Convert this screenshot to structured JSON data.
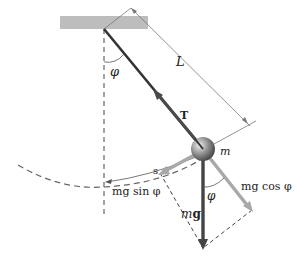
{
  "diagram": {
    "labels": {
      "length": "L",
      "angle_top": "φ",
      "tension": "T",
      "mass": "m",
      "arc": "s",
      "tangential_component": "mg sin φ",
      "radial_component": "mg cos φ",
      "weight_m": "m",
      "weight_g": "g",
      "angle_bottom": "φ"
    },
    "colors": {
      "ceiling": "#b8b8b8",
      "string": "#333333",
      "tension_arrow": "#555555",
      "component_arrows": "#a8a8a8",
      "weight_arrow": "#444444",
      "dashed": "#555555",
      "bob": "#8a8a8a"
    }
  }
}
